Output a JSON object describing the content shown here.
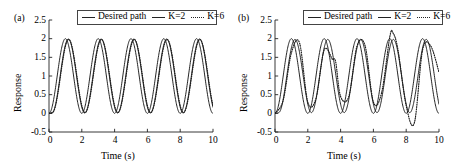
{
  "figure": {
    "background": "#ffffff",
    "axis_color": "#222222",
    "line_color": "#1a1a1a"
  },
  "panels": [
    {
      "tag": "(a)",
      "legend": [
        {
          "label": "Desired path",
          "style": "solid",
          "icon": "line-solid-icon"
        },
        {
          "label": "K=2",
          "style": "solid",
          "icon": "line-solid-icon"
        },
        {
          "label": "K=6",
          "style": "dotted",
          "icon": "line-dotted-icon"
        }
      ],
      "axes": {
        "xlabel": "Time (s)",
        "ylabel": "Response",
        "xticks": [
          "0",
          "2",
          "4",
          "6",
          "8",
          "10"
        ],
        "yticks": [
          "2.5",
          "2",
          "1.5",
          "1",
          "0.5",
          "0",
          "-0.5"
        ]
      }
    },
    {
      "tag": "(b)",
      "legend": [
        {
          "label": "Desired path",
          "style": "solid",
          "icon": "line-solid-icon"
        },
        {
          "label": "K=2",
          "style": "solid",
          "icon": "line-solid-icon"
        },
        {
          "label": "K=6",
          "style": "dotted",
          "icon": "line-dotted-icon"
        }
      ],
      "axes": {
        "xlabel": "Time (s)",
        "ylabel": "Response",
        "xticks": [
          "0",
          "2",
          "4",
          "6",
          "8",
          "10"
        ],
        "yticks": [
          "2.5",
          "2",
          "1.5",
          "1",
          "0.5",
          "0",
          "-0.5"
        ]
      }
    }
  ],
  "chart_data": [
    {
      "type": "line",
      "title": "(a)",
      "xlabel": "Time (s)",
      "ylabel": "Response",
      "xlim": [
        0,
        10
      ],
      "ylim": [
        -0.5,
        2.5
      ],
      "xticks": [
        0,
        2,
        4,
        6,
        8,
        10
      ],
      "yticks": [
        -0.5,
        0,
        0.5,
        1,
        1.5,
        2,
        2.5
      ],
      "grid": false,
      "legend_position": "top-center",
      "series": [
        {
          "name": "Desired path",
          "style": "solid",
          "model": "sine",
          "amplitude": 1.0,
          "offset": 1.0,
          "period": 2.0,
          "phase_shift": 0.0,
          "x": [
            0,
            0.5,
            1.0,
            1.5,
            2.0,
            2.5,
            3.0,
            3.5,
            4.0,
            4.5,
            5.0,
            5.5,
            6.0,
            6.5,
            7.0,
            7.5,
            8.0,
            8.5,
            9.0,
            9.5,
            10.0
          ],
          "values": [
            0,
            1.0,
            2.0,
            1.0,
            0,
            1.0,
            2.0,
            1.0,
            0,
            1.0,
            2.0,
            1.0,
            0,
            1.0,
            2.0,
            1.0,
            0,
            1.0,
            2.0,
            1.0,
            0
          ]
        },
        {
          "name": "K=2",
          "style": "solid",
          "model": "sine-lagged",
          "amplitude": 0.99,
          "offset": 1.0,
          "period": 2.0,
          "phase_shift": 0.18,
          "x": [
            0,
            0.5,
            1.0,
            1.5,
            2.0,
            2.5,
            3.0,
            3.5,
            4.0,
            4.5,
            5.0,
            5.5,
            6.0,
            6.5,
            7.0,
            7.5,
            8.0,
            8.5,
            9.0,
            9.5,
            10.0
          ],
          "values": [
            0,
            0.7,
            1.85,
            1.32,
            0.05,
            0.7,
            1.85,
            1.32,
            0.05,
            0.7,
            1.85,
            1.32,
            0.05,
            0.7,
            1.85,
            1.32,
            0.05,
            0.7,
            1.85,
            1.32,
            0.22
          ]
        },
        {
          "name": "K=6",
          "style": "dotted",
          "model": "sine-lagged",
          "amplitude": 0.98,
          "offset": 1.0,
          "period": 2.0,
          "phase_shift": 0.2,
          "x": [
            0,
            0.5,
            1.0,
            1.5,
            2.0,
            2.5,
            3.0,
            3.5,
            4.0,
            4.5,
            5.0,
            5.5,
            6.0,
            6.5,
            7.0,
            7.5,
            8.0,
            8.5,
            9.0,
            9.5,
            10.0
          ],
          "values": [
            0,
            0.66,
            1.83,
            1.38,
            0.06,
            0.66,
            1.83,
            1.38,
            0.06,
            0.66,
            1.83,
            1.38,
            0.06,
            0.66,
            1.83,
            1.38,
            0.06,
            0.66,
            1.83,
            1.38,
            0.25
          ]
        }
      ]
    },
    {
      "type": "line",
      "title": "(b)",
      "xlabel": "Time (s)",
      "ylabel": "Response",
      "xlim": [
        0,
        10
      ],
      "ylim": [
        -0.5,
        2.5
      ],
      "xticks": [
        0,
        2,
        4,
        6,
        8,
        10
      ],
      "yticks": [
        -0.5,
        0,
        0.5,
        1,
        1.5,
        2,
        2.5
      ],
      "grid": false,
      "legend_position": "top-center",
      "series": [
        {
          "name": "Desired path",
          "style": "solid",
          "model": "sine",
          "amplitude": 1.0,
          "offset": 1.0,
          "period": 2.0,
          "phase_shift": 0.0,
          "x": [
            0,
            0.5,
            1.0,
            1.5,
            2.0,
            2.5,
            3.0,
            3.5,
            4.0,
            4.5,
            5.0,
            5.5,
            6.0,
            6.5,
            7.0,
            7.5,
            8.0,
            8.5,
            9.0,
            9.5,
            10.0
          ],
          "values": [
            0,
            1.0,
            2.0,
            1.0,
            0,
            1.0,
            2.0,
            1.0,
            0,
            1.0,
            2.0,
            1.0,
            0,
            1.0,
            2.0,
            1.0,
            0,
            1.0,
            2.0,
            1.0,
            0
          ]
        },
        {
          "name": "K=2",
          "style": "solid",
          "model": "sine-lagged",
          "amplitude": 0.98,
          "offset": 1.0,
          "period": 2.0,
          "phase_shift": 0.22,
          "x": [
            0,
            0.5,
            1.0,
            1.5,
            2.0,
            2.5,
            3.0,
            3.5,
            4.0,
            4.5,
            5.0,
            5.5,
            6.0,
            6.5,
            7.0,
            7.5,
            8.0,
            8.5,
            9.0,
            9.5,
            10.0
          ],
          "values": [
            0,
            0.62,
            1.82,
            1.42,
            0.05,
            0.62,
            1.82,
            1.42,
            0.05,
            0.62,
            1.82,
            1.42,
            0.05,
            0.62,
            1.82,
            1.42,
            0.05,
            0.62,
            1.82,
            1.42,
            0.3
          ]
        },
        {
          "name": "K=6",
          "style": "dotted",
          "model": "sine-distorted",
          "amplitude": 1.0,
          "offset": 1.0,
          "period": 2.0,
          "phase_shift": 0.35,
          "notes": "lags the desired path; dips to ~1.4 near t=3.6; overshoots to ~2.15 near t=7.2; undershoots to ~-0.25 near t=8.5",
          "x": [
            0,
            0.5,
            1.0,
            1.5,
            2.0,
            2.5,
            3.0,
            3.5,
            3.7,
            4.0,
            4.5,
            5.0,
            5.5,
            6.0,
            6.5,
            7.0,
            7.2,
            7.5,
            8.0,
            8.5,
            9.0,
            9.5,
            10.0
          ],
          "values": [
            0,
            0.35,
            1.62,
            1.88,
            0.3,
            0.4,
            1.7,
            1.45,
            1.38,
            0.45,
            0.45,
            1.8,
            1.8,
            0.3,
            0.55,
            2.05,
            2.15,
            1.7,
            0.2,
            -0.25,
            1.7,
            1.8,
            1.1
          ]
        }
      ]
    }
  ]
}
